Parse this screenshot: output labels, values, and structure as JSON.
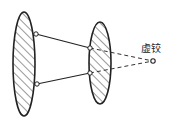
{
  "diagram": {
    "type": "mechanism-schematic",
    "labels": {
      "virtual_hinge": "虚铰"
    },
    "colors": {
      "stroke": "#222222",
      "hatch": "#333333",
      "background": "#ffffff"
    },
    "bodies": [
      {
        "name": "left-rigid-body",
        "cx": 24,
        "cy": 64,
        "rx": 11,
        "ry": 52,
        "hatched": true
      },
      {
        "name": "right-rigid-body",
        "cx": 100,
        "cy": 63,
        "rx": 11,
        "ry": 41,
        "hatched": true
      }
    ],
    "hinges": [
      {
        "name": "left-top-hinge",
        "x": 36,
        "y": 34
      },
      {
        "name": "left-bottom-hinge",
        "x": 37,
        "y": 84
      },
      {
        "name": "right-top-hinge",
        "x": 90,
        "y": 48
      },
      {
        "name": "right-bottom-hinge",
        "x": 90,
        "y": 73
      },
      {
        "name": "virtual-hinge",
        "x": 153,
        "y": 61
      }
    ],
    "links": [
      {
        "name": "upper-link",
        "from": "left-top-hinge",
        "to": "right-top-hinge",
        "style": "solid"
      },
      {
        "name": "lower-link",
        "from": "left-bottom-hinge",
        "to": "right-bottom-hinge",
        "style": "solid"
      },
      {
        "name": "upper-extension",
        "from": "right-top-hinge",
        "to": "virtual-hinge",
        "style": "dashed"
      },
      {
        "name": "lower-extension",
        "from": "right-bottom-hinge",
        "to": "virtual-hinge",
        "style": "dashed"
      }
    ]
  }
}
